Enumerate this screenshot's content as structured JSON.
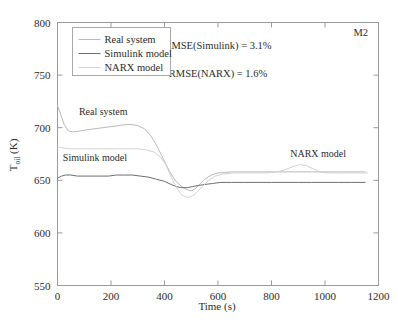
{
  "figure": {
    "corner_label": "M2",
    "background": "#ffffff"
  },
  "annotations": [
    {
      "id": "rmse-simulink",
      "text": "RMSE(Simulink) = 3.1%",
      "x": 600,
      "y": 775
    },
    {
      "id": "rmse-narx",
      "text": "RMSE(NARX) = 1.6%",
      "x": 600,
      "y": 748
    }
  ],
  "inplot_labels": [
    {
      "id": "label-real-system",
      "text": "Real system",
      "x": 80,
      "y": 712
    },
    {
      "id": "label-simulink-model",
      "text": "Simulink model",
      "x": 20,
      "y": 668
    },
    {
      "id": "label-narx-model",
      "text": "NARX model",
      "x": 870,
      "y": 672
    }
  ],
  "legend": {
    "position": "top-left",
    "entries": [
      {
        "label": "Real system",
        "color": "#b9b9b9"
      },
      {
        "label": "Simulink model",
        "color": "#6e6e6e"
      },
      {
        "label": "NARX model",
        "color": "#d2d2d2"
      }
    ]
  },
  "chart_data": {
    "type": "line",
    "title": "",
    "subtitle": "",
    "xlabel": "Time (s)",
    "ylabel": "T_oil (K)",
    "ylabel_display": "T",
    "ylabel_subscript": "oil",
    "ylabel_unit": " (K)",
    "xlim": [
      0,
      1200
    ],
    "ylim": [
      550,
      800
    ],
    "xticks": [
      0,
      200,
      400,
      600,
      800,
      1000,
      1200
    ],
    "yticks": [
      550,
      600,
      650,
      700,
      750,
      800
    ],
    "xtick_labels": [
      "0",
      "200",
      "400",
      "600",
      "800",
      "1000",
      "1200"
    ],
    "ytick_labels": [
      "550",
      "600",
      "650",
      "700",
      "750",
      "800"
    ],
    "grid": false,
    "legend_position": "upper left",
    "series": [
      {
        "name": "Real system",
        "color": "#b9b9b9",
        "x": [
          0,
          10,
          25,
          40,
          60,
          85,
          110,
          140,
          170,
          200,
          230,
          255,
          275,
          300,
          325,
          350,
          375,
          400,
          420,
          440,
          455,
          470,
          485,
          500,
          515,
          530,
          550,
          575,
          600,
          650,
          700,
          750,
          800,
          850,
          900,
          950,
          1000,
          1050,
          1100,
          1150
        ],
        "y": [
          721,
          714,
          703,
          697,
          696,
          697,
          698,
          699,
          700,
          701,
          702,
          703,
          703,
          702,
          699,
          692,
          681,
          668,
          658,
          650,
          646,
          643,
          641,
          640,
          642,
          646,
          651,
          655,
          657,
          658,
          658,
          658,
          658,
          658,
          658,
          658,
          658,
          658,
          658,
          658
        ]
      },
      {
        "name": "Simulink model",
        "color": "#6e6e6e",
        "x": [
          0,
          15,
          30,
          50,
          75,
          100,
          130,
          160,
          190,
          220,
          250,
          280,
          310,
          340,
          370,
          400,
          425,
          445,
          465,
          485,
          505,
          525,
          550,
          580,
          610,
          650,
          700,
          750,
          800,
          850,
          900,
          950,
          1000,
          1050,
          1100,
          1150
        ],
        "y": [
          652,
          654,
          655,
          655,
          654,
          654,
          654,
          654,
          654,
          655,
          655,
          655,
          654,
          653,
          651,
          649,
          646,
          644,
          643,
          643,
          644,
          645,
          646,
          647,
          648,
          648,
          648,
          648,
          648,
          648,
          648,
          648,
          648,
          648,
          648,
          648
        ]
      },
      {
        "name": "NARX model",
        "color": "#d2d2d2",
        "x": [
          0,
          15,
          35,
          60,
          90,
          120,
          150,
          180,
          210,
          240,
          270,
          300,
          330,
          360,
          385,
          405,
          420,
          435,
          450,
          465,
          480,
          495,
          510,
          525,
          545,
          565,
          590,
          620,
          660,
          700,
          740,
          780,
          820,
          850,
          880,
          905,
          930,
          955,
          980,
          1010,
          1050,
          1090,
          1130,
          1160
        ],
        "y": [
          682,
          681,
          680,
          680,
          680,
          680,
          680,
          680,
          680,
          680,
          680,
          680,
          679,
          677,
          672,
          665,
          656,
          648,
          641,
          636,
          634,
          634,
          636,
          640,
          645,
          650,
          654,
          656,
          657,
          657,
          657,
          657,
          658,
          660,
          663,
          665,
          664,
          661,
          658,
          657,
          657,
          657,
          657,
          657
        ]
      }
    ]
  }
}
